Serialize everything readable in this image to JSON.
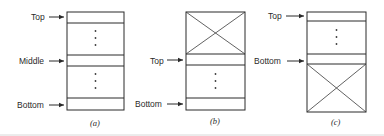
{
  "figure": {
    "panels": [
      {
        "id": "a",
        "caption": "(a)",
        "pointers": [
          {
            "label": "Top",
            "row": "top"
          },
          {
            "label": "Middle",
            "row": "middle"
          },
          {
            "label": "Bottom",
            "row": "bottom"
          }
        ],
        "crossed_region": "none"
      },
      {
        "id": "b",
        "caption": "(b)",
        "pointers": [
          {
            "label": "Top",
            "row": "top"
          },
          {
            "label": "Bottom",
            "row": "bottom"
          }
        ],
        "crossed_region": "upper"
      },
      {
        "id": "c",
        "caption": "(c)",
        "pointers": [
          {
            "label": "Top",
            "row": "top"
          },
          {
            "label": "Bottom",
            "row": "bottom"
          }
        ],
        "crossed_region": "lower"
      }
    ],
    "colors": {
      "ink": "#2a2a2a",
      "background": "#ffffff"
    }
  }
}
